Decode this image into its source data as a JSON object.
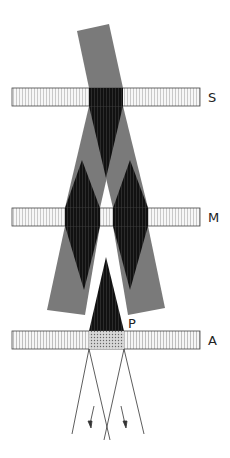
{
  "diagram": {
    "type": "optics-plate-diagram",
    "plates": [
      {
        "id": "S",
        "label": "S",
        "x": 12,
        "y": 88,
        "width": 188,
        "height": 18
      },
      {
        "id": "M",
        "label": "M",
        "x": 12,
        "y": 208,
        "width": 188,
        "height": 18
      },
      {
        "id": "A",
        "label": "A",
        "x": 12,
        "y": 331,
        "width": 188,
        "height": 18
      }
    ],
    "point_label": "P",
    "colors": {
      "beam_gray": "#7a7a7a",
      "overlap_dark": "#111111",
      "plate_stroke": "#444444",
      "plate_fill": "#f4f4f4",
      "line": "#333333"
    }
  }
}
